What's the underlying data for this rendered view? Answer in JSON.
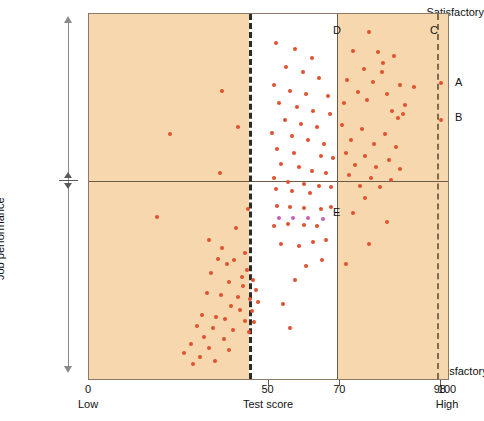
{
  "chart_data": {
    "type": "scatter",
    "title": "",
    "xlabel": "Test score",
    "ylabel": "Job performance",
    "xlim": [
      0,
      100
    ],
    "ylim": [
      0,
      100
    ],
    "grid": false,
    "legend_position": "none",
    "x_ticks": [
      {
        "value": 0,
        "label": "0",
        "sublabel": "Low"
      },
      {
        "value": 50,
        "label": "50",
        "sublabel": ""
      },
      {
        "value": 70,
        "label": "70",
        "sublabel": ""
      },
      {
        "value": 98,
        "label": "98",
        "sublabel": ""
      },
      {
        "value": 100,
        "label": "100",
        "sublabel": "High"
      }
    ],
    "y_ticks": [
      {
        "value": 100,
        "label": "Satisfactory"
      },
      {
        "value": 50,
        "label": ""
      },
      {
        "value": 0,
        "label": "Unsatisfactory"
      }
    ],
    "reference_lines": [
      {
        "name": "cutoff-50",
        "axis": "x",
        "value": 50,
        "style": "dashed",
        "color": "#2b2b2b"
      },
      {
        "name": "cutoff-70",
        "axis": "x",
        "value": 70,
        "style": "solid",
        "color": "#6b5b47"
      },
      {
        "name": "cutoff-98",
        "axis": "x",
        "value": 98,
        "style": "dashed",
        "color": "#7d6a4f"
      },
      {
        "name": "performance-midline",
        "axis": "y",
        "value": 50,
        "style": "solid",
        "color": "#6b5b47"
      }
    ],
    "shaded_bands": [
      {
        "name": "below-50-band",
        "x_from": 0,
        "x_to": 50,
        "color": "#f7d8ae"
      },
      {
        "name": "above-70-band",
        "x_from": 70,
        "x_to": 100,
        "color": "#f7d8ae"
      }
    ],
    "annotations": [
      {
        "id": "A",
        "x": 98,
        "y": 81,
        "placement": "right-of-plot"
      },
      {
        "id": "B",
        "x": 98,
        "y": 71,
        "placement": "right-of-plot"
      },
      {
        "id": "C",
        "x": 95,
        "y": 97,
        "placement": "in-plot"
      },
      {
        "id": "D",
        "x": 68,
        "y": 97,
        "placement": "in-plot"
      },
      {
        "id": "E",
        "x": 68,
        "y": 47,
        "placement": "in-plot"
      }
    ],
    "point_color": "#e0512f",
    "highlight_point_color": "#c560b8",
    "series": [
      {
        "name": "applicants",
        "color": "#e0512f",
        "points": [
          [
            37.0,
            79.0
          ],
          [
            41.5,
            69.0
          ],
          [
            36.5,
            56.5
          ],
          [
            44.2,
            46.5
          ],
          [
            41.0,
            41.5
          ],
          [
            33.5,
            38.0
          ],
          [
            37.0,
            36.0
          ],
          [
            43.5,
            34.5
          ],
          [
            36.0,
            33.0
          ],
          [
            40.5,
            32.5
          ],
          [
            38.5,
            31.5
          ],
          [
            44.0,
            30.0
          ],
          [
            34.0,
            29.0
          ],
          [
            42.5,
            28.0
          ],
          [
            45.8,
            27.0
          ],
          [
            39.0,
            26.5
          ],
          [
            43.0,
            25.5
          ],
          [
            46.5,
            24.5
          ],
          [
            33.0,
            23.5
          ],
          [
            36.8,
            23.0
          ],
          [
            41.5,
            22.5
          ],
          [
            44.8,
            22.0
          ],
          [
            47.0,
            21.0
          ],
          [
            39.5,
            20.0
          ],
          [
            42.0,
            19.0
          ],
          [
            45.5,
            18.5
          ],
          [
            31.5,
            17.5
          ],
          [
            35.5,
            17.0
          ],
          [
            38.0,
            16.5
          ],
          [
            43.5,
            16.0
          ],
          [
            46.0,
            15.5
          ],
          [
            30.0,
            14.5
          ],
          [
            34.5,
            14.0
          ],
          [
            40.0,
            13.5
          ],
          [
            44.5,
            13.0
          ],
          [
            32.0,
            11.5
          ],
          [
            37.5,
            11.0
          ],
          [
            28.5,
            9.5
          ],
          [
            33.5,
            8.5
          ],
          [
            39.0,
            8.0
          ],
          [
            26.5,
            7.0
          ],
          [
            31.0,
            6.0
          ],
          [
            35.0,
            5.0
          ],
          [
            29.0,
            4.0
          ],
          [
            22.5,
            67.0
          ],
          [
            19.0,
            44.5
          ],
          [
            52.0,
            92.0
          ],
          [
            57.5,
            90.5
          ],
          [
            62.0,
            88.0
          ],
          [
            55.0,
            85.5
          ],
          [
            59.5,
            84.0
          ],
          [
            64.0,
            82.5
          ],
          [
            51.5,
            80.5
          ],
          [
            56.0,
            79.0
          ],
          [
            60.5,
            78.0
          ],
          [
            66.5,
            77.5
          ],
          [
            53.0,
            75.5
          ],
          [
            58.0,
            74.5
          ],
          [
            62.5,
            73.5
          ],
          [
            67.0,
            72.5
          ],
          [
            54.5,
            71.0
          ],
          [
            59.0,
            70.0
          ],
          [
            63.5,
            69.0
          ],
          [
            51.0,
            67.5
          ],
          [
            56.5,
            66.5
          ],
          [
            61.0,
            65.5
          ],
          [
            65.5,
            64.5
          ],
          [
            52.5,
            63.0
          ],
          [
            57.0,
            62.0
          ],
          [
            64.5,
            61.0
          ],
          [
            68.0,
            60.5
          ],
          [
            53.5,
            59.0
          ],
          [
            58.5,
            58.0
          ],
          [
            62.0,
            57.0
          ],
          [
            66.0,
            56.5
          ],
          [
            51.5,
            55.0
          ],
          [
            55.5,
            54.0
          ],
          [
            60.0,
            53.5
          ],
          [
            64.0,
            53.0
          ],
          [
            67.5,
            52.5
          ],
          [
            52.0,
            52.0
          ],
          [
            56.5,
            51.5
          ],
          [
            61.5,
            51.0
          ],
          [
            52.5,
            47.5
          ],
          [
            56.0,
            47.0
          ],
          [
            60.0,
            46.8
          ],
          [
            64.5,
            46.5
          ],
          [
            67.5,
            47.2
          ],
          [
            51.5,
            42.0
          ],
          [
            55.5,
            42.5
          ],
          [
            60.0,
            42.2
          ],
          [
            63.5,
            41.8
          ],
          [
            66.0,
            38.0
          ],
          [
            53.5,
            37.0
          ],
          [
            58.5,
            36.5
          ],
          [
            62.5,
            37.5
          ],
          [
            65.0,
            32.5
          ],
          [
            60.5,
            31.0
          ],
          [
            57.5,
            27.0
          ],
          [
            54.0,
            20.5
          ],
          [
            56.0,
            14.0
          ],
          [
            78.0,
            95.0
          ],
          [
            73.5,
            90.0
          ],
          [
            80.5,
            89.5
          ],
          [
            85.0,
            88.5
          ],
          [
            82.0,
            86.5
          ],
          [
            76.5,
            85.0
          ],
          [
            81.5,
            84.0
          ],
          [
            72.0,
            82.0
          ],
          [
            79.0,
            81.5
          ],
          [
            86.5,
            80.5
          ],
          [
            90.5,
            80.0
          ],
          [
            75.0,
            78.5
          ],
          [
            83.0,
            78.0
          ],
          [
            77.5,
            76.5
          ],
          [
            71.0,
            75.5
          ],
          [
            88.0,
            75.0
          ],
          [
            84.5,
            73.5
          ],
          [
            87.5,
            72.5
          ],
          [
            86.0,
            71.5
          ],
          [
            70.5,
            69.5
          ],
          [
            76.0,
            68.5
          ],
          [
            82.5,
            67.0
          ],
          [
            73.0,
            65.5
          ],
          [
            79.5,
            64.5
          ],
          [
            85.5,
            63.5
          ],
          [
            71.5,
            62.0
          ],
          [
            77.0,
            61.0
          ],
          [
            83.5,
            60.0
          ],
          [
            74.0,
            58.5
          ],
          [
            80.0,
            58.0
          ],
          [
            86.5,
            57.5
          ],
          [
            72.5,
            56.0
          ],
          [
            78.5,
            55.0
          ],
          [
            84.0,
            54.5
          ],
          [
            75.5,
            53.0
          ],
          [
            81.0,
            52.5
          ],
          [
            98.0,
            81.0
          ],
          [
            98.0,
            71.0
          ],
          [
            77.0,
            49.5
          ],
          [
            73.5,
            45.5
          ],
          [
            83.0,
            43.0
          ],
          [
            78.0,
            37.0
          ],
          [
            71.5,
            31.5
          ]
        ]
      },
      {
        "name": "highlighted-applicants",
        "color": "#c560b8",
        "points": [
          [
            52.8,
            44.0
          ],
          [
            56.8,
            44.2
          ],
          [
            61.0,
            44.0
          ],
          [
            65.3,
            43.8
          ]
        ]
      }
    ]
  },
  "axes": {
    "y_top_label": "Satisfactory",
    "y_bottom_label": "Unsatisfactory",
    "y_title": "Job performance",
    "x_title": "Test score",
    "x_low_label": "Low",
    "x_high_label": "High"
  }
}
